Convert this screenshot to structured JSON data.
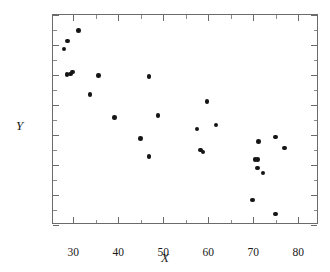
{
  "chart_data": {
    "type": "scatter",
    "title": "",
    "xlabel": "X",
    "ylabel": "Y",
    "xlim": [
      25.5,
      84.6
    ],
    "ylim": [
      6,
      13
    ],
    "grid": false,
    "legend": null,
    "x_major_ticks": [
      30,
      40,
      50,
      60,
      70,
      80
    ],
    "x_minor_ticks": [
      35,
      45,
      55,
      65,
      75
    ],
    "y_major_ticks": [
      6,
      7,
      8,
      9,
      10,
      11,
      12,
      13
    ],
    "x_tick_labels": [
      "30",
      "40",
      "50",
      "60",
      "70",
      "80"
    ],
    "y_tick_labels": [
      "6",
      "7",
      "8",
      "9",
      "10",
      "11",
      "12",
      "13"
    ],
    "marker": "filled-circle",
    "marker_color": "#151515",
    "n_points": 27,
    "points": [
      {
        "x": 27.9,
        "y": 11.87
      },
      {
        "x": 28.7,
        "y": 12.13
      },
      {
        "x": 28.6,
        "y": 11.02
      },
      {
        "x": 29.4,
        "y": 11.03
      },
      {
        "x": 29.8,
        "y": 11.1
      },
      {
        "x": 31.1,
        "y": 12.48
      },
      {
        "x": 33.7,
        "y": 10.35
      },
      {
        "x": 35.6,
        "y": 10.99
      },
      {
        "x": 39.1,
        "y": 9.59
      },
      {
        "x": 44.9,
        "y": 8.88
      },
      {
        "x": 46.8,
        "y": 10.95
      },
      {
        "x": 46.8,
        "y": 8.28
      },
      {
        "x": 48.8,
        "y": 9.65
      },
      {
        "x": 57.5,
        "y": 9.2
      },
      {
        "x": 58.3,
        "y": 8.5
      },
      {
        "x": 58.8,
        "y": 8.44
      },
      {
        "x": 59.7,
        "y": 10.12
      },
      {
        "x": 61.7,
        "y": 9.33
      },
      {
        "x": 69.8,
        "y": 6.83
      },
      {
        "x": 70.4,
        "y": 8.19
      },
      {
        "x": 70.9,
        "y": 7.9
      },
      {
        "x": 71.2,
        "y": 8.79
      },
      {
        "x": 72.2,
        "y": 7.73
      },
      {
        "x": 74.9,
        "y": 8.94
      },
      {
        "x": 75.0,
        "y": 6.37
      },
      {
        "x": 76.9,
        "y": 8.56
      },
      {
        "x": 71.0,
        "y": 8.19
      }
    ]
  }
}
